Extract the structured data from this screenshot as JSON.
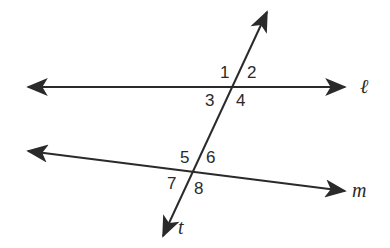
{
  "diagram": {
    "type": "parallel lines cut by a transversal",
    "colors": {
      "line": "#2a2a2a",
      "background": "#ffffff"
    },
    "lines": [
      {
        "name": "ℓ",
        "from": [
          28,
          87
        ],
        "to": [
          345,
          87
        ]
      },
      {
        "name": "m",
        "from": [
          28,
          151
        ],
        "to": [
          345,
          191
        ]
      },
      {
        "name": "t",
        "from": [
          267,
          12
        ],
        "to": [
          163,
          236
        ]
      }
    ],
    "labels": {
      "line_l": "ℓ",
      "line_m": "m",
      "line_t": "t"
    },
    "angles": {
      "a1": "1",
      "a2": "2",
      "a3": "3",
      "a4": "4",
      "a5": "5",
      "a6": "6",
      "a7": "7",
      "a8": "8"
    }
  }
}
